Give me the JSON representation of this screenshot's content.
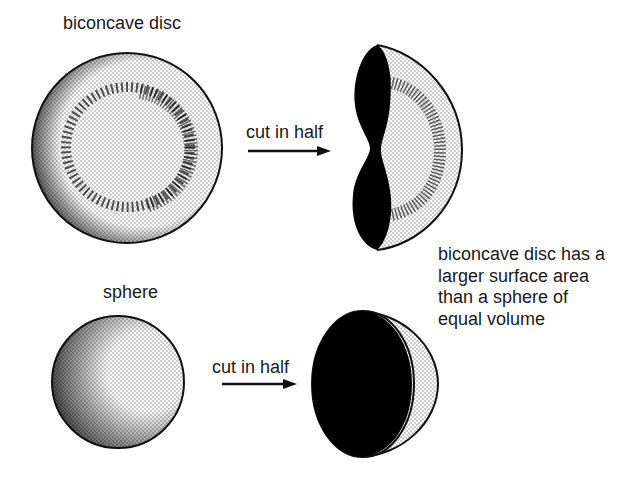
{
  "diagram": {
    "title_top": "biconcave disc",
    "title_bottom": "sphere",
    "arrow_top_label": "cut in half",
    "arrow_bottom_label": "cut in half",
    "note_lines": [
      "biconcave disc has a",
      "larger surface area",
      "than a sphere of",
      "equal volume"
    ],
    "colors": {
      "ink": "#111111",
      "stipple": "#9a9a9a",
      "background": "#ffffff"
    }
  }
}
